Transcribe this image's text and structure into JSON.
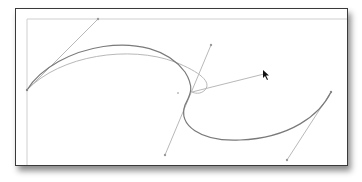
{
  "canvas": {
    "description": "Vector path editing: bezier curve with anchor points and direction handles",
    "colors": {
      "frame_border": "#3a3a3a",
      "path_stroke": "#7a7a7a",
      "preview_path_stroke": "#b4b4b4",
      "handle_line": "#b0b0b0",
      "guide_line": "#c8c8c8",
      "cursor": "#111111"
    },
    "anchors": [
      {
        "name": "anchor-left",
        "x": 27,
        "y": 90
      },
      {
        "name": "anchor-middle",
        "x": 192,
        "y": 92
      },
      {
        "name": "anchor-right",
        "x": 331,
        "y": 92
      }
    ],
    "handles": [
      {
        "name": "handle-left",
        "from": [
          27,
          90
        ],
        "to": [
          98,
          19
        ]
      },
      {
        "name": "handle-middle-in",
        "from": [
          211,
          45
        ],
        "to": [
          165,
          155
        ]
      },
      {
        "name": "handle-middle-drag",
        "from": [
          192,
          92
        ],
        "to": [
          264,
          74
        ]
      },
      {
        "name": "handle-right",
        "from": [
          331,
          92
        ],
        "to": [
          287,
          160
        ]
      }
    ],
    "cursor": {
      "type": "direct-selection-arrow",
      "x": 264,
      "y": 72
    }
  }
}
